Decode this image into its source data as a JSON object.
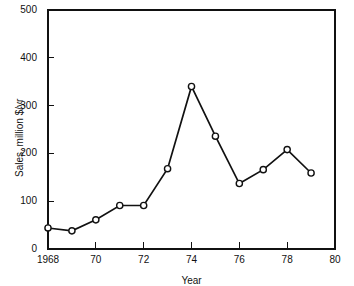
{
  "chart_data": {
    "type": "line",
    "title": "",
    "xlabel": "Year",
    "ylabel": "Sales, million $/yr",
    "xlim": [
      1968,
      1980
    ],
    "ylim": [
      0,
      500
    ],
    "grid": false,
    "legend": "none",
    "x": [
      1968,
      1969,
      1970,
      1971,
      1972,
      1973,
      1974,
      1975,
      1976,
      1977,
      1978,
      1979
    ],
    "values": [
      44,
      38,
      61,
      91,
      91,
      168,
      340,
      236,
      137,
      166,
      208,
      159
    ],
    "xtick_values": [
      1968,
      1970,
      1972,
      1974,
      1976,
      1978,
      1980
    ],
    "xtick_labels": [
      "1968",
      "70",
      "72",
      "74",
      "76",
      "78",
      "80"
    ],
    "ytick_values": [
      0,
      100,
      200,
      300,
      400,
      500
    ],
    "ytick_labels": [
      "0",
      "100",
      "200",
      "300",
      "400",
      "500"
    ],
    "marker": "open-circle",
    "line_color": "#111111",
    "marker_fill": "#111111"
  },
  "figure": {
    "background": "#ffffff"
  }
}
